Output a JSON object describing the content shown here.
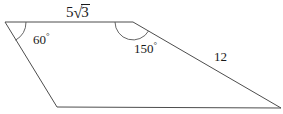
{
  "figure": {
    "background_color": "#ffffff",
    "stroke_color": "#4d4d4d",
    "text_color": "#1a1a1a",
    "vertices": [
      {
        "name": "top-left",
        "x": 5,
        "y": 22
      },
      {
        "name": "top-right",
        "x": 133,
        "y": 22
      },
      {
        "name": "bottom-right",
        "x": 281,
        "y": 108
      },
      {
        "name": "bottom-left",
        "x": 57,
        "y": 107
      }
    ],
    "path": "M 5 22 L 133 22 L 281 108 L 57 107 Z"
  },
  "labels": {
    "side_top": {
      "text": "5√3",
      "coefficient": "5",
      "radical_sign": "√",
      "radicand": "3"
    },
    "angle_left": {
      "value": "60",
      "degree_symbol": "°",
      "text": "60°"
    },
    "angle_top_right": {
      "value": "150",
      "degree_symbol": "°",
      "text": "150°"
    },
    "side_right": {
      "value": "12",
      "text": "12"
    }
  },
  "arcs": {
    "angle_left_arc": {
      "path": "M 26 22 A 21 21 0 0 1 15.5 40.2",
      "note": "60-degree arc at top-left vertex"
    },
    "angle_top_right_arc": {
      "path": "M 115 22 A 18 18 0 0 0 148.6 30.9",
      "note": "150-degree arc at top-right vertex"
    }
  }
}
